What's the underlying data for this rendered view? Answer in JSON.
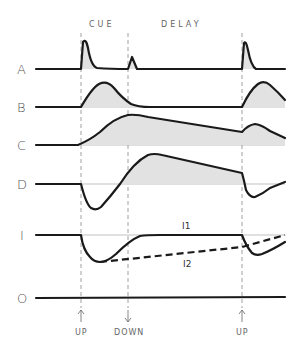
{
  "phases": [
    {
      "label": "CUE",
      "x": 104,
      "y": 27
    },
    {
      "label": "DELAY",
      "x": 182,
      "y": 27
    }
  ],
  "event_markers": [
    {
      "label": "UP",
      "x": 81,
      "direction": "up"
    },
    {
      "label": "DOWN",
      "x": 128,
      "direction": "down"
    },
    {
      "label": "UP",
      "x": 242,
      "direction": "up"
    }
  ],
  "rows": [
    {
      "label": "A",
      "baseline_y": 69
    },
    {
      "label": "B",
      "baseline_y": 107
    },
    {
      "label": "C",
      "baseline_y": 145
    },
    {
      "label": "D",
      "baseline_y": 184
    },
    {
      "label": "I",
      "baseline_y": 235
    },
    {
      "label": "O",
      "baseline_y": 298
    }
  ],
  "curve_labels": [
    {
      "label": "I1",
      "x": 187,
      "y": 229
    },
    {
      "label": "I2",
      "x": 187,
      "y": 265
    }
  ],
  "colors": {
    "trace": "#1a1a1a",
    "fill": "#e2e2e2",
    "text": "#555555"
  }
}
